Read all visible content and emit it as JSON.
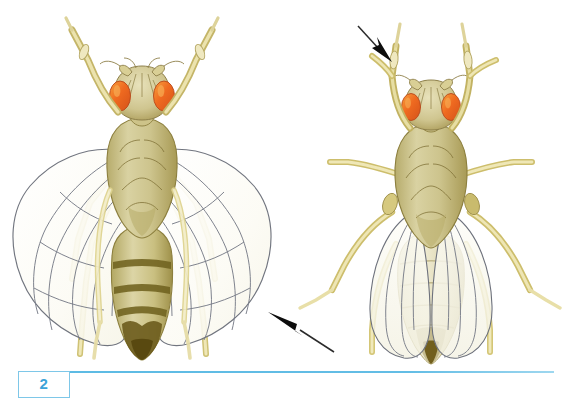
{
  "figure": {
    "number": "2",
    "caption_text": "",
    "accent_color": "#3ca3d8",
    "rule_color": "#5dbbe4",
    "background_color": "#ffffff"
  },
  "palette": {
    "body_tan": "#c9bf82",
    "body_tan_light": "#ded7a8",
    "body_shadow": "#a89a55",
    "abdomen_band": "#7a6b25",
    "eye_orange": "#ef6a20",
    "eye_orange_light": "#f59a3c",
    "leg_yellow": "#d8cb74",
    "leg_pale": "#efe9bf",
    "wing_fill": "#fbfbf7",
    "wing_vein": "#6b6f7d",
    "outline": "#6e6a45",
    "arrow_black": "#111111"
  },
  "specimens": [
    {
      "id": "left-fly",
      "name": "wild-type-fly",
      "label": "",
      "wing_type": "long-straight-wings",
      "eye_color": "orange",
      "position": "left"
    },
    {
      "id": "right-fly",
      "name": "mutant-fly",
      "label": "",
      "wing_type": "curled-wings-over-abdomen",
      "eye_color": "orange",
      "position": "right"
    }
  ],
  "annotations": [
    {
      "id": "arrow-wing",
      "name": "arrow-pointing-to-wing",
      "direction": "up-left",
      "target": "left-fly-wing-tip",
      "label": ""
    },
    {
      "id": "arrow-leg",
      "name": "arrow-pointing-to-leg",
      "direction": "down-right",
      "target": "right-fly-foreleg",
      "label": ""
    }
  ]
}
